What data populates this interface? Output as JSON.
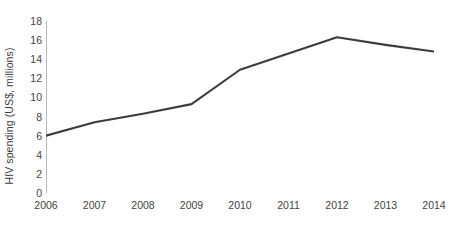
{
  "chart_data": {
    "type": "line",
    "title": "",
    "subtitle": "",
    "xlabel": "",
    "ylabel": "HIV spending (US$, millions)",
    "categories": [
      "2006",
      "2007",
      "2008",
      "2009",
      "2010",
      "2011",
      "2012",
      "2013",
      "2014"
    ],
    "x": [
      2006,
      2007,
      2008,
      2009,
      2010,
      2011,
      2012,
      2013,
      2014
    ],
    "values": [
      6.0,
      7.4,
      8.3,
      9.3,
      12.9,
      14.6,
      16.3,
      15.5,
      14.8
    ],
    "series": [
      {
        "name": "HIV spending",
        "values": [
          6.0,
          7.4,
          8.3,
          9.3,
          12.9,
          14.6,
          16.3,
          15.5,
          14.8
        ]
      }
    ],
    "xlim": [
      2006,
      2014
    ],
    "ylim": [
      0,
      18
    ],
    "y_ticks": [
      0,
      2,
      4,
      6,
      8,
      10,
      12,
      14,
      16,
      18
    ],
    "y_tick_labels": [
      "0",
      "2",
      "4",
      "6",
      "8",
      "10",
      "12",
      "14",
      "16",
      "18"
    ],
    "x_ticks": [
      2006,
      2007,
      2008,
      2009,
      2010,
      2011,
      2012,
      2013,
      2014
    ],
    "x_tick_labels": [
      "2006",
      "2007",
      "2008",
      "2009",
      "2010",
      "2011",
      "2012",
      "2013",
      "2014"
    ],
    "grid": false,
    "legend": false,
    "legend_position": "none",
    "markers": false,
    "annotations": [],
    "colors": {
      "line": "#3c3c3c",
      "axis": "#b9b9b9",
      "tick_text": "#444444",
      "axis_title": "#3c3c3c",
      "background": "#ffffff"
    },
    "line_width": 2.1
  }
}
